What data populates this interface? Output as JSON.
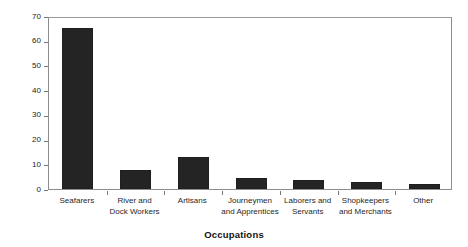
{
  "chart_data": {
    "type": "bar",
    "title": "",
    "xlabel": "Occupations",
    "ylabel": "Percent of Deaths Recorded",
    "ylim": [
      0,
      70
    ],
    "yticks": [
      0,
      10,
      20,
      30,
      40,
      50,
      60,
      70
    ],
    "grid": false,
    "legend": "none",
    "bar_color": "#242424",
    "categories": [
      "Seafarers",
      "River and\nDock Workers",
      "Artisans",
      "Journeymen\nand Apprentices",
      "Laborers and\nServants",
      "Shopkeepers\nand Merchants",
      "Other"
    ],
    "values": [
      65,
      7.5,
      13,
      4.5,
      3.5,
      2.8,
      2
    ]
  },
  "axes": {
    "y_title": "Percent of Deaths Recorded",
    "x_title": "Occupations",
    "tick_labels": [
      "0",
      "10",
      "20",
      "30",
      "40",
      "50",
      "60",
      "70"
    ]
  },
  "title_strip": ""
}
